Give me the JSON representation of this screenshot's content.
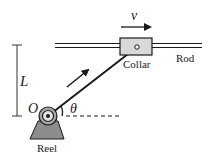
{
  "diagram": {
    "labels": {
      "velocity": "v",
      "length": "L",
      "origin": "O",
      "angle": "θ",
      "collar": "Collar",
      "rod": "Rod",
      "reel": "Reel"
    },
    "colors": {
      "stroke": "#1a1a1a",
      "collar_fill": "#d9d9d9",
      "reel_fill": "#a6a6a6",
      "base_fill": "#8c8c8c"
    }
  }
}
